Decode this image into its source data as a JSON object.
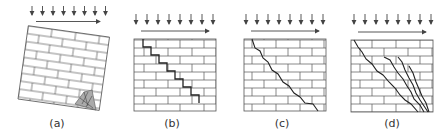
{
  "figure": {
    "panels": [
      {
        "id": "a",
        "label": "(a)",
        "failure_mode": "rocking / toe crushing",
        "center_x": 57
      },
      {
        "id": "b",
        "label": "(b)",
        "failure_mode": "sliding along stepped bed joints",
        "center_x": 172
      },
      {
        "id": "c",
        "label": "(c)",
        "failure_mode": "diagonal tension crack",
        "center_x": 282
      },
      {
        "id": "d",
        "label": "(d)",
        "failure_mode": "multiple diagonal cracks",
        "center_x": 392
      }
    ],
    "loads": {
      "vertical_arrows_per_panel": 8,
      "vertical_arrow_symbol": "↓",
      "horizontal_arrow_symbol": "→"
    },
    "colors": {
      "stroke": "#444444",
      "crush_zone": "#aaaaaa",
      "background": "#ffffff"
    }
  }
}
